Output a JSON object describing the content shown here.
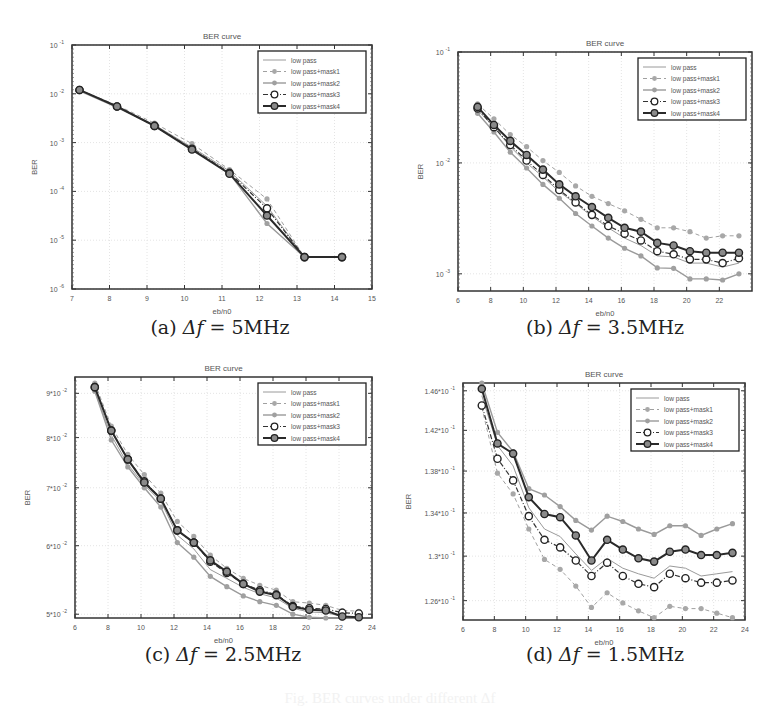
{
  "figure": {
    "footer_caption": "Fig. BER curves under different Δf"
  },
  "chart_data": [
    {
      "id": "a",
      "type": "line",
      "title": "BER curve",
      "xlabel": "eb/n0",
      "ylabel": "BER",
      "yscale": "log",
      "xlim": [
        7,
        15
      ],
      "ylim": [
        1e-06,
        0.1
      ],
      "xticks": [
        7,
        8,
        9,
        10,
        11,
        12,
        13,
        14,
        15
      ],
      "yticks": [
        1e-06,
        1e-05,
        0.0001,
        0.001,
        0.01,
        0.1
      ],
      "ytick_labels": [
        "10^-6",
        "10^-5",
        "10^-4",
        "10^-3",
        "10^-2",
        "10^-1"
      ],
      "grid": true,
      "legend_position": "upper right",
      "caption": {
        "prefix": "(a) ",
        "symbol": "Δf",
        "value": " = 5MHz"
      },
      "x": [
        7.2,
        8.2,
        9.2,
        10.2,
        11.2,
        12.2,
        13.2,
        14.2
      ],
      "series": [
        {
          "name": "low pass",
          "values": [
            0.012,
            0.0055,
            0.0023,
            0.0008,
            0.00026,
            5e-05,
            4.5e-06,
            4.5e-06
          ]
        },
        {
          "name": "low pass+mask1",
          "values": [
            0.012,
            0.0058,
            0.0025,
            0.00095,
            0.00028,
            7e-05,
            4.5e-06,
            4.5e-06
          ]
        },
        {
          "name": "low pass+mask2",
          "values": [
            0.0115,
            0.0053,
            0.0022,
            0.00075,
            0.00023,
            2.2e-05,
            4.5e-06,
            4.5e-06
          ]
        },
        {
          "name": "low pass+mask3",
          "values": [
            0.012,
            0.0055,
            0.0022,
            0.00075,
            0.00024,
            4.5e-05,
            4.5e-06,
            4.5e-06
          ]
        },
        {
          "name": "low pass+mask4",
          "values": [
            0.012,
            0.0055,
            0.0022,
            0.00072,
            0.00023,
            3.2e-05,
            4.5e-06,
            4.5e-06
          ]
        }
      ]
    },
    {
      "id": "b",
      "type": "line",
      "title": "BER curve",
      "xlabel": "eb/n0",
      "ylabel": "BER",
      "yscale": "log",
      "xlim": [
        6,
        24
      ],
      "ylim": [
        0.0007,
        0.1
      ],
      "xticks": [
        6,
        8,
        10,
        12,
        14,
        16,
        18,
        20,
        22
      ],
      "yticks": [
        0.001,
        0.01,
        0.1
      ],
      "ytick_labels": [
        "10^-3",
        "10^-2",
        "10^-1"
      ],
      "grid": true,
      "legend_position": "upper right",
      "caption": {
        "prefix": "(b) ",
        "symbol": "Δf",
        "value": " = 3.5MHz"
      },
      "x": [
        7.2,
        8.2,
        9.2,
        10.2,
        11.2,
        12.2,
        13.2,
        14.2,
        15.2,
        16.2,
        17.2,
        18.2,
        19.2,
        20.2,
        21.2,
        22.2,
        23.2
      ],
      "series": [
        {
          "name": "low pass",
          "values": [
            0.03,
            0.021,
            0.014,
            0.01,
            0.0075,
            0.0055,
            0.0043,
            0.0033,
            0.0026,
            0.0021,
            0.0018,
            0.00145,
            0.00142,
            0.00125,
            0.00125,
            0.00115,
            0.00125
          ]
        },
        {
          "name": "low pass+mask1",
          "values": [
            0.034,
            0.025,
            0.018,
            0.014,
            0.0105,
            0.0082,
            0.0062,
            0.005,
            0.0043,
            0.0037,
            0.0031,
            0.0026,
            0.0026,
            0.0024,
            0.0021,
            0.0022,
            0.0022
          ]
        },
        {
          "name": "low pass+mask2",
          "values": [
            0.028,
            0.019,
            0.0125,
            0.009,
            0.0064,
            0.0048,
            0.0035,
            0.0027,
            0.0021,
            0.0017,
            0.00145,
            0.00113,
            0.00112,
            0.0009,
            0.0009,
            0.00088,
            0.001
          ]
        },
        {
          "name": "low pass+mask3",
          "values": [
            0.031,
            0.021,
            0.0145,
            0.0105,
            0.0078,
            0.0057,
            0.0044,
            0.0034,
            0.0027,
            0.0023,
            0.002,
            0.0016,
            0.0015,
            0.00135,
            0.00135,
            0.00125,
            0.00138
          ]
        },
        {
          "name": "low pass+mask4",
          "values": [
            0.032,
            0.022,
            0.0158,
            0.0118,
            0.0087,
            0.0064,
            0.005,
            0.004,
            0.0032,
            0.0026,
            0.0024,
            0.0019,
            0.0018,
            0.0016,
            0.00155,
            0.00155,
            0.00155
          ]
        }
      ]
    },
    {
      "id": "c",
      "type": "line",
      "title": "BER curve",
      "xlabel": "eb/n0",
      "ylabel": "BER",
      "yscale": "log",
      "xlim": [
        6,
        24
      ],
      "ylim": [
        0.0495,
        0.094
      ],
      "xticks": [
        6,
        8,
        10,
        12,
        14,
        16,
        18,
        20,
        22,
        24
      ],
      "yticks": [
        0.05,
        0.06,
        0.07,
        0.08,
        0.09
      ],
      "ytick_labels": [
        "5*10^-2",
        "6*10^-2",
        "7*10^-2",
        "8*10^-2",
        "9*10^-2"
      ],
      "grid": true,
      "legend_position": "upper right",
      "caption": {
        "prefix": "(c) ",
        "symbol": "Δf",
        "value": " = 2.5MHz"
      },
      "x": [
        7.2,
        8.2,
        9.2,
        10.2,
        11.2,
        12.2,
        13.2,
        14.2,
        15.2,
        16.2,
        17.2,
        18.2,
        19.2,
        20.2,
        21.2,
        22.2,
        23.2
      ],
      "series": [
        {
          "name": "low pass",
          "values": [
            0.0905,
            0.0805,
            0.0745,
            0.0705,
            0.0675,
            0.0617,
            0.0595,
            0.0563,
            0.055,
            0.0537,
            0.0528,
            0.0522,
            0.0508,
            0.0503,
            0.0502,
            0.0497,
            0.0496
          ]
        },
        {
          "name": "low pass+mask1",
          "values": [
            0.0925,
            0.0825,
            0.0765,
            0.0725,
            0.069,
            0.064,
            0.0615,
            0.0585,
            0.0565,
            0.055,
            0.054,
            0.0533,
            0.0517,
            0.0515,
            0.0512,
            0.0505,
            0.0504
          ]
        },
        {
          "name": "low pass+mask2",
          "values": [
            0.0905,
            0.0795,
            0.074,
            0.07,
            0.0665,
            0.0605,
            0.0582,
            0.0553,
            0.0538,
            0.0525,
            0.0517,
            0.0512,
            0.05,
            0.0496,
            0.0495,
            0.049,
            0.0487
          ]
        },
        {
          "name": "low pass+mask3",
          "values": [
            0.0915,
            0.0815,
            0.0755,
            0.0712,
            0.068,
            0.0625,
            0.0605,
            0.0575,
            0.0558,
            0.0542,
            0.0533,
            0.0527,
            0.0511,
            0.0508,
            0.0507,
            0.0502,
            0.0501
          ]
        },
        {
          "name": "low pass+mask4",
          "values": [
            0.0915,
            0.0815,
            0.0755,
            0.071,
            0.068,
            0.0625,
            0.0605,
            0.0577,
            0.056,
            0.0542,
            0.0531,
            0.0526,
            0.051,
            0.0506,
            0.0505,
            0.0497,
            0.0496
          ]
        }
      ]
    },
    {
      "id": "d",
      "type": "line",
      "title": "BER curve",
      "xlabel": "eb/n0",
      "ylabel": "BER",
      "yscale": "log",
      "xlim": [
        6,
        24
      ],
      "ylim": [
        0.1243,
        0.1468
      ],
      "xticks": [
        6,
        8,
        10,
        12,
        14,
        16,
        18,
        20,
        22,
        24
      ],
      "yticks": [
        0.126,
        0.13,
        0.134,
        0.138,
        0.142,
        0.146
      ],
      "ytick_labels": [
        "1.26*10^-1",
        "1.3*10^-1",
        "1.34*10^-1",
        "1.38*10^-1",
        "1.42*10^-1",
        "1.46*10^-1"
      ],
      "grid": true,
      "legend_position": "upper right",
      "caption": {
        "prefix": "(d) ",
        "symbol": "Δf",
        "value": " = 1.5MHz"
      },
      "x": [
        7.2,
        8.2,
        9.2,
        10.2,
        11.2,
        12.2,
        13.2,
        14.2,
        15.2,
        16.2,
        17.2,
        18.2,
        19.2,
        20.2,
        21.2,
        22.2,
        23.2
      ],
      "series": [
        {
          "name": "low pass",
          "values": [
            0.1455,
            0.1405,
            0.1385,
            0.1345,
            0.1325,
            0.1318,
            0.1302,
            0.1287,
            0.1298,
            0.1289,
            0.1284,
            0.128,
            0.1291,
            0.1289,
            0.1282,
            0.1284,
            0.1286
          ]
        },
        {
          "name": "low pass+mask1",
          "values": [
            0.1443,
            0.1378,
            0.1358,
            0.1325,
            0.1297,
            0.1288,
            0.1273,
            0.1254,
            0.1267,
            0.1258,
            0.1251,
            0.1245,
            0.1255,
            0.1253,
            0.1253,
            0.1249,
            0.1245
          ]
        },
        {
          "name": "low pass+mask2",
          "values": [
            0.1468,
            0.1418,
            0.1399,
            0.1363,
            0.1357,
            0.1346,
            0.1333,
            0.1324,
            0.1337,
            0.1332,
            0.1325,
            0.132,
            0.1328,
            0.1328,
            0.1319,
            0.1325,
            0.133
          ]
        },
        {
          "name": "low pass+mask3",
          "values": [
            0.1445,
            0.1392,
            0.1371,
            0.1337,
            0.1315,
            0.1308,
            0.1296,
            0.1282,
            0.1294,
            0.1282,
            0.1275,
            0.1272,
            0.1284,
            0.128,
            0.1276,
            0.1276,
            0.1278
          ]
        },
        {
          "name": "low pass+mask4",
          "values": [
            0.1462,
            0.1407,
            0.1397,
            0.1355,
            0.1339,
            0.1336,
            0.1319,
            0.1296,
            0.1315,
            0.1306,
            0.1298,
            0.1295,
            0.1304,
            0.1306,
            0.1301,
            0.1301,
            0.1303
          ]
        }
      ]
    }
  ]
}
